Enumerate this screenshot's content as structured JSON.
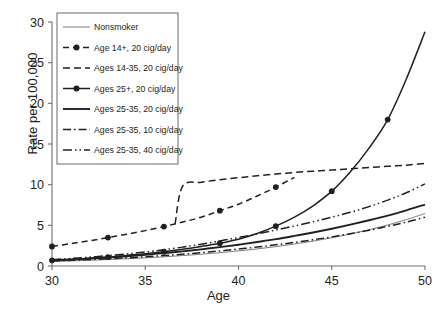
{
  "chart_data": {
    "type": "line",
    "title": "",
    "xlabel": "Age",
    "ylabel": "Rate per 100,000",
    "xlim": [
      30,
      50
    ],
    "ylim": [
      0,
      30
    ],
    "xticks": [
      30,
      35,
      40,
      45,
      50
    ],
    "yticks": [
      0,
      5,
      10,
      15,
      20,
      25,
      30
    ],
    "grid": false,
    "legend_position": "upper left",
    "x": [
      30,
      31,
      32,
      33,
      34,
      35,
      36,
      37,
      38,
      39,
      40,
      41,
      42,
      43,
      44,
      45,
      46,
      47,
      48,
      49,
      50
    ],
    "series": [
      {
        "name": "Nonsmoker",
        "style": "solid-thin",
        "markers": false,
        "values": [
          0.55,
          0.62,
          0.7,
          0.79,
          0.89,
          1.0,
          1.13,
          1.28,
          1.45,
          1.64,
          1.86,
          2.1,
          2.38,
          2.7,
          3.06,
          3.47,
          3.93,
          4.45,
          5.04,
          5.7,
          6.45
        ]
      },
      {
        "name": "Age 14+, 20 cig/day",
        "style": "dashed-marker",
        "markers": true,
        "values": [
          2.4,
          2.75,
          3.1,
          3.5,
          3.9,
          4.35,
          4.85,
          5.4,
          6.0,
          6.8,
          7.6,
          8.6,
          9.7,
          10.9,
          12.3,
          14.6,
          17.0,
          19.7,
          22.8,
          26.2,
          30.0
        ],
        "clipped_above_axis": true,
        "visible_to_age": 43.6
      },
      {
        "name": "Ages 14-35, 20 cig/day",
        "style": "dashed",
        "markers": false,
        "branch_from_age": 36.6,
        "values": [
          null,
          null,
          null,
          null,
          null,
          null,
          null,
          9.8,
          10.3,
          10.6,
          10.85,
          11.1,
          11.3,
          11.5,
          11.65,
          11.8,
          11.95,
          12.1,
          12.25,
          12.4,
          12.6
        ]
      },
      {
        "name": "Ages 25+, 20 cig/day",
        "style": "solid-marker",
        "markers": true,
        "values": [
          0.7,
          0.8,
          0.95,
          1.1,
          1.3,
          1.5,
          1.75,
          2.05,
          2.4,
          2.8,
          3.3,
          4.0,
          4.9,
          6.0,
          7.4,
          9.2,
          11.6,
          14.5,
          18.0,
          23.0,
          28.8
        ]
      },
      {
        "name": "Ages 25-35, 20 cig/day",
        "style": "solid-thick",
        "markers": false,
        "values": [
          0.7,
          0.8,
          0.92,
          1.05,
          1.2,
          1.38,
          1.58,
          1.8,
          2.05,
          2.32,
          2.62,
          2.95,
          3.3,
          3.7,
          4.12,
          4.58,
          5.08,
          5.62,
          6.2,
          6.85,
          7.55
        ]
      },
      {
        "name": "Ages 25-35, 10 cig/day",
        "style": "dash-dot",
        "markers": false,
        "values": [
          0.62,
          0.7,
          0.79,
          0.89,
          1.0,
          1.13,
          1.28,
          1.45,
          1.64,
          1.85,
          2.08,
          2.33,
          2.6,
          2.9,
          3.22,
          3.58,
          3.97,
          4.4,
          4.88,
          5.4,
          6.0
        ]
      },
      {
        "name": "Ages 25-35, 40 cig/day",
        "style": "dash-dot-dot",
        "markers": false,
        "values": [
          0.78,
          0.92,
          1.08,
          1.27,
          1.48,
          1.72,
          2.0,
          2.32,
          2.68,
          3.08,
          3.5,
          3.95,
          4.42,
          4.92,
          5.45,
          6.0,
          6.6,
          7.3,
          8.1,
          9.0,
          10.1
        ]
      }
    ],
    "legend_entries": [
      {
        "label": "Nonsmoker",
        "style": "solid-thin"
      },
      {
        "label": "Age 14+, 20 cig/day",
        "style": "dashed-marker"
      },
      {
        "label": "Ages 14-35, 20 cig/day",
        "style": "dashed"
      },
      {
        "label": "Ages 25+, 20 cig/day",
        "style": "solid-marker"
      },
      {
        "label": "Ages 25-35, 20 cig/day",
        "style": "solid-thick"
      },
      {
        "label": "Ages 25-35, 10 cig/day",
        "style": "dash-dot"
      },
      {
        "label": "Ages 25-35, 40 cig/day",
        "style": "dash-dot-dot"
      }
    ],
    "colors": {
      "line": "#231f20",
      "axis": "#6d6e71",
      "background": "#ffffff"
    }
  }
}
